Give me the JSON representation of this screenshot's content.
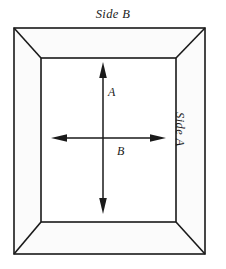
{
  "figure": {
    "type": "technical-diagram",
    "background_color": "#ffffff",
    "line_color": "#1a1a1a",
    "frame_fill_color": "#fbfbfb",
    "opening_fill_color": "#ffffff"
  },
  "labels": {
    "side_b": "Side B",
    "side_a": "Side A",
    "dimension_a": "A",
    "dimension_b": "B"
  },
  "geometry": {
    "outer_rect": {
      "x": 14,
      "y": 28,
      "width": 191,
      "height": 226
    },
    "inner_rect": {
      "x": 41,
      "y": 58,
      "width": 135,
      "height": 164
    },
    "vertical_arrow": {
      "x": 103,
      "y_top": 62,
      "y_bottom": 214
    },
    "horizontal_arrow": {
      "y": 138,
      "x_left": 51,
      "x_right": 166
    }
  },
  "annotations": {
    "side_a_rotation_degrees": 90,
    "vertical_arrow_label": "A",
    "horizontal_arrow_label": "B",
    "arrow_heads": "double-ended"
  }
}
